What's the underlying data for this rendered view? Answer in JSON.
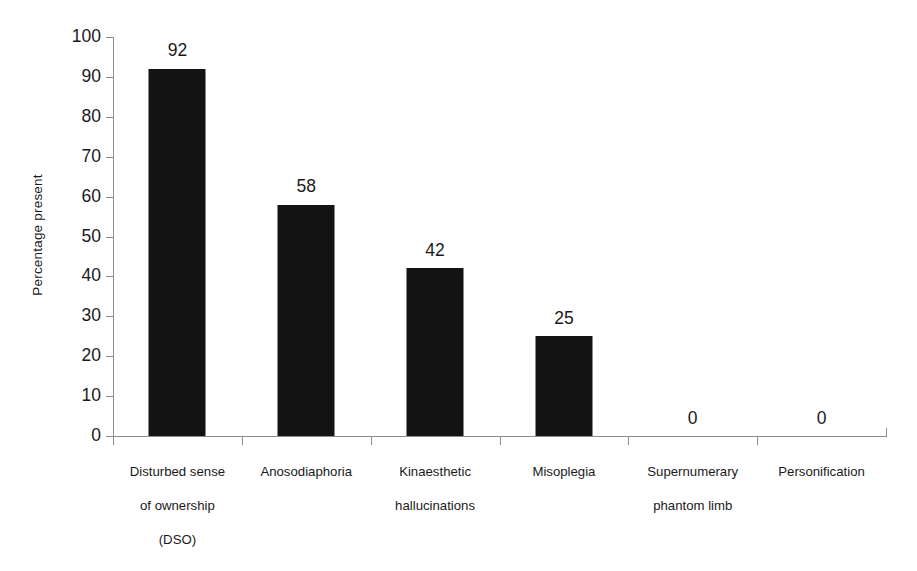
{
  "chart_data": {
    "type": "bar",
    "title": "",
    "xlabel": "",
    "ylabel": "Percentage present",
    "categories": [
      "Disturbed sense of ownership (DSO)",
      "Anosodiaphoria",
      "Kinaesthetic hallucinations",
      "Misoplegia",
      "Supernumerary phantom limb",
      "Personification"
    ],
    "category_lines": [
      [
        "Disturbed sense",
        "of  ownership",
        "(DSO)"
      ],
      [
        "Anosodiaphoria"
      ],
      [
        "Kinaesthetic",
        "hallucinations"
      ],
      [
        "Misoplegia"
      ],
      [
        "Supernumerary",
        "phantom limb"
      ],
      [
        "Personification"
      ]
    ],
    "values": [
      92,
      58,
      42,
      25,
      0,
      0
    ],
    "value_labels": [
      "92",
      "58",
      "42",
      "25",
      "0",
      "0"
    ],
    "ylim": [
      0,
      100
    ],
    "ytick_labels": [
      "100",
      "90",
      "80",
      "70",
      "60",
      "50",
      "40",
      "30",
      "20",
      "10",
      "0"
    ],
    "ytick_values": [
      100,
      90,
      80,
      70,
      60,
      50,
      40,
      30,
      20,
      10,
      0
    ],
    "grid": false,
    "legend": false,
    "bar_color": "#131313",
    "axis_color": "#8d8d8d",
    "background_color": "#ffffff"
  }
}
